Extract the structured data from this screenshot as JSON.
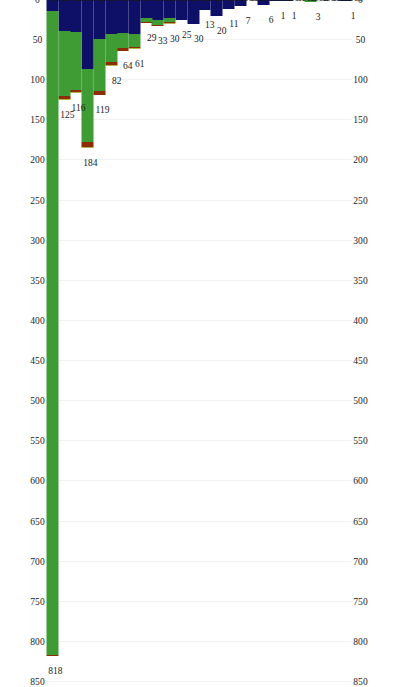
{
  "chart_data": {
    "type": "bar",
    "orientation": "horizontal-stacked",
    "title": "",
    "subtitle": "",
    "xlabel": "",
    "ylabel": "",
    "xlim": [
      0,
      850
    ],
    "grid": true,
    "legend_position": "none",
    "axis_ticks": [
      "850",
      "800",
      "750",
      "700",
      "650",
      "600",
      "550",
      "500",
      "450",
      "400",
      "350",
      "300",
      "250",
      "200",
      "150",
      "100",
      "50",
      "0"
    ],
    "axis_tick_values": [
      850,
      800,
      750,
      700,
      650,
      600,
      550,
      500,
      450,
      400,
      350,
      300,
      250,
      200,
      150,
      100,
      50,
      0
    ],
    "axis_top_ticks": [
      "850",
      "800",
      "750",
      "700",
      "650",
      "600",
      "550",
      "500",
      "450",
      "400",
      "350",
      "300",
      "250",
      "200",
      "150",
      "100",
      "50",
      "0"
    ],
    "axis_bottom_ticks": [
      "850",
      "800",
      "750",
      "700",
      "650",
      "600",
      "550",
      "500",
      "450",
      "400",
      "350",
      "300",
      "250",
      "200",
      "150",
      "100",
      "50",
      "0"
    ],
    "categories": [
      "1989",
      "1990",
      "1991",
      "1992",
      "1993",
      "1994",
      "1995",
      "1996",
      "1997",
      "1998",
      "1999",
      "2000",
      "2001",
      "2002",
      "2003",
      "2004",
      "2005",
      "2006",
      "2007",
      "2008",
      "2009",
      "2010",
      "2011",
      "2012",
      "2013",
      "2014"
    ],
    "totals": [
      1,
      0,
      0,
      3,
      0,
      1,
      1,
      6,
      0,
      7,
      11,
      20,
      13,
      30,
      25,
      30,
      33,
      29,
      61,
      64,
      82,
      119,
      184,
      116,
      125,
      818
    ],
    "value_labels": [
      "1",
      "",
      "",
      "3",
      "",
      "1",
      "1",
      "6",
      "",
      "7",
      "11",
      "20",
      "13",
      "30",
      "25",
      "30",
      "33",
      "29",
      "61",
      "64",
      "82",
      "119",
      "184",
      "116",
      "125",
      "818"
    ],
    "colors": {
      "navy": "#0d1066",
      "green": "#3f9c35",
      "darkred": "#8c2d06",
      "olive": "#b3b14a",
      "grid": "#f2f2f2",
      "background": "#ffffff",
      "text": "#1a1a1a"
    },
    "series": [
      {
        "name": "series-navy",
        "color": "#0d1066",
        "values": [
          1,
          0,
          0,
          0,
          0,
          1,
          1,
          6,
          0,
          7,
          11,
          20,
          13,
          30,
          25,
          22,
          25,
          22,
          42,
          41,
          42,
          49,
          86,
          40,
          39,
          14
        ]
      },
      {
        "name": "series-green",
        "color": "#3f9c35",
        "values": [
          0,
          0,
          0,
          3,
          0,
          0,
          0,
          0,
          0,
          0,
          0,
          0,
          0,
          0,
          0,
          5,
          6,
          6,
          16,
          19,
          35,
          65,
          91,
          72,
          81,
          803
        ]
      },
      {
        "name": "series-darkred",
        "color": "#8c2d06",
        "values": [
          0,
          0,
          0,
          0,
          0,
          0,
          0,
          0,
          0,
          0,
          0,
          0,
          0,
          0,
          0,
          2,
          2,
          1,
          2,
          3,
          4,
          4,
          6,
          3,
          4,
          1
        ]
      },
      {
        "name": "series-olive",
        "color": "#b3b14a",
        "values": [
          0,
          0,
          0,
          0,
          0,
          0,
          0,
          0,
          0,
          0,
          0,
          0,
          0,
          0,
          0,
          1,
          0,
          0,
          1,
          1,
          1,
          1,
          1,
          1,
          1,
          0
        ]
      }
    ]
  }
}
